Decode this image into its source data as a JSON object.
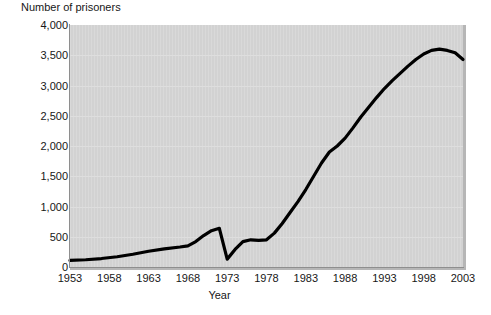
{
  "chart_data": {
    "type": "line",
    "title": "",
    "ylabel": "Number of prisoners",
    "xlabel": "Year",
    "grid": true,
    "legend": false,
    "xlim": [
      1953,
      2003
    ],
    "ylim": [
      0,
      4000
    ],
    "ytick_labels": [
      "4,000",
      "3,500",
      "3,000",
      "2,500",
      "2,000",
      "1,500",
      "1,000",
      "500",
      "0"
    ],
    "ytick_values": [
      4000,
      3500,
      3000,
      2500,
      2000,
      1500,
      1000,
      500,
      0
    ],
    "xtick_labels": [
      "1953",
      "1958",
      "1963",
      "1968",
      "1973",
      "1978",
      "1983",
      "1988",
      "1993",
      "1998",
      "2003"
    ],
    "xtick_values": [
      1953,
      1958,
      1963,
      1968,
      1973,
      1978,
      1983,
      1988,
      1993,
      1998,
      2003
    ],
    "series": [
      {
        "name": "Number of prisoners",
        "color": "#000000",
        "x": [
          1953,
          1955,
          1957,
          1959,
          1961,
          1963,
          1965,
          1967,
          1968,
          1969,
          1970,
          1971,
          1972,
          1973,
          1974,
          1975,
          1976,
          1977,
          1978,
          1979,
          1980,
          1981,
          1982,
          1983,
          1984,
          1985,
          1986,
          1987,
          1988,
          1989,
          1990,
          1991,
          1992,
          1993,
          1994,
          1995,
          1996,
          1997,
          1998,
          1999,
          2000,
          2001,
          2002,
          2003
        ],
        "y": [
          110,
          120,
          140,
          170,
          210,
          260,
          300,
          330,
          350,
          420,
          520,
          600,
          640,
          130,
          290,
          420,
          450,
          440,
          450,
          560,
          720,
          900,
          1080,
          1280,
          1500,
          1720,
          1900,
          2000,
          2130,
          2300,
          2480,
          2640,
          2800,
          2950,
          3080,
          3200,
          3320,
          3430,
          3520,
          3580,
          3600,
          3580,
          3540,
          3430
        ]
      }
    ]
  },
  "axes": {
    "y_axis_title": "Number of prisoners",
    "x_axis_title": "Year"
  },
  "colors": {
    "plot_background": "#d2d2d2",
    "line": "#000000",
    "gridline": "#dedede",
    "axis": "#8e8e8e",
    "text": "#171717"
  }
}
